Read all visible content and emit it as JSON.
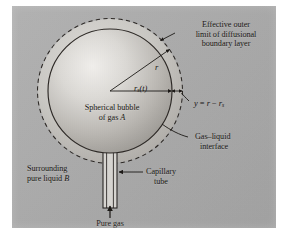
{
  "figure": {
    "panel_color": "#aaaaaa",
    "ink_color": "#1a1714",
    "bubble_fill_light": "#e8e6e2",
    "bubble_fill_dark": "#9b9893",
    "boundary_layer_fill": "#cfcdc8"
  },
  "labels": {
    "boundary_layer": {
      "line1": "Effective outer",
      "line2": "limit of diffusional",
      "line3": "boundary layer"
    },
    "bubble": {
      "line1": "Spherical bubble",
      "line2_prefix": "of gas ",
      "line2_italic": "A"
    },
    "gas_liquid_interface": {
      "line1": "Gas–liquid",
      "line2": "interface"
    },
    "capillary_tube": {
      "line1": "Capillary",
      "line2": "tube"
    },
    "surrounding_liquid": {
      "line1": "Surrounding",
      "line2_prefix": "pure liquid ",
      "line2_italic": "B"
    },
    "pure_gas": {
      "line1": "Pure gas",
      "line2_italic": "A"
    }
  },
  "math": {
    "radius_outer": "r",
    "radius_surface_base": "r",
    "radius_surface_sub": "s",
    "radius_surface_arg": "(t)",
    "film_thickness_lhs": "y",
    "film_thickness_eq": " = ",
    "film_thickness_r": "r",
    "film_thickness_minus": " − ",
    "film_thickness_rs_base": "r",
    "film_thickness_rs_sub": "s"
  }
}
